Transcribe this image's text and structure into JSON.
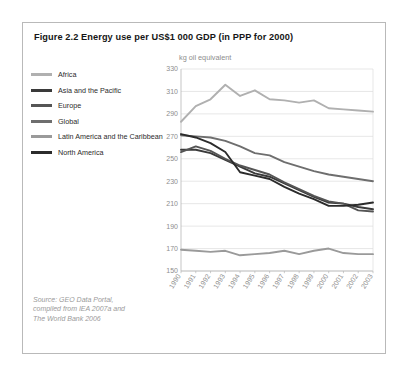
{
  "figure": {
    "title": "Figure 2.2 Energy use per US$1 000 GDP (in PPP for 2000)",
    "unit_label": "kg oil equivalent",
    "source_lines": [
      "Source: GEO Data Portal,",
      "compiled from IEA 2007a and",
      "The World Bank 2006"
    ]
  },
  "legend": {
    "items": [
      {
        "label": "Africa",
        "color": "#b0b0b0"
      },
      {
        "label": "Asia and the Pacific",
        "color": "#3a3a3a"
      },
      {
        "label": "Europe",
        "color": "#555555"
      },
      {
        "label": "Global",
        "color": "#6e6e6e"
      },
      {
        "label": "Latin America and the Caribbean",
        "color": "#9a9a9a"
      },
      {
        "label": "North America",
        "color": "#2b2b2b"
      }
    ]
  },
  "chart_data": {
    "type": "line",
    "title": "Figure 2.2 Energy use per US$1 000 GDP (in PPP for 2000)",
    "xlabel": "",
    "ylabel": "kg oil equivalent",
    "ylim": [
      150,
      330
    ],
    "ytick_step": 20,
    "yticks": [
      150,
      170,
      190,
      210,
      230,
      250,
      270,
      290,
      310,
      330
    ],
    "grid": true,
    "legend_position": "left-outside",
    "x": [
      1990,
      1991,
      1992,
      1993,
      1994,
      1995,
      1996,
      1997,
      1998,
      1999,
      2000,
      2001,
      2002,
      2003
    ],
    "categories": [
      "1990",
      "1991",
      "1992",
      "1993",
      "1994",
      "1995",
      "1996",
      "1997",
      "1998",
      "1999",
      "2000",
      "2001",
      "2002",
      "2003"
    ],
    "series": [
      {
        "name": "Africa",
        "color": "#b0b0b0",
        "values": [
          283,
          297,
          303,
          316,
          306,
          311,
          303,
          302,
          300,
          302,
          295,
          294,
          293,
          292
        ]
      },
      {
        "name": "Asia and the Pacific",
        "color": "#3a3a3a",
        "values": [
          258,
          258,
          255,
          249,
          243,
          237,
          234,
          228,
          222,
          216,
          211,
          210,
          207,
          205
        ]
      },
      {
        "name": "Europe",
        "color": "#555555",
        "values": [
          256,
          261,
          257,
          250,
          244,
          240,
          236,
          229,
          223,
          217,
          212,
          210,
          204,
          203
        ]
      },
      {
        "name": "Global",
        "color": "#6e6e6e",
        "values": [
          271,
          270,
          269,
          266,
          261,
          255,
          253,
          247,
          243,
          239,
          236,
          234,
          232,
          230
        ]
      },
      {
        "name": "Latin America and the Caribbean",
        "color": "#9a9a9a",
        "values": [
          169,
          168,
          167,
          168,
          164,
          165,
          166,
          168,
          165,
          168,
          170,
          166,
          165,
          165
        ]
      },
      {
        "name": "North America",
        "color": "#2b2b2b",
        "values": [
          272,
          269,
          264,
          256,
          238,
          235,
          232,
          225,
          219,
          214,
          208,
          208,
          209,
          211
        ]
      }
    ]
  }
}
